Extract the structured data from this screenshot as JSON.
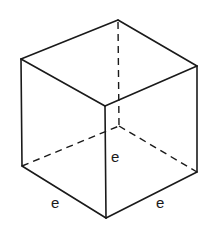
{
  "diagram": {
    "type": "cube-wireframe",
    "vertices": {
      "top_left": [
        21,
        59
      ],
      "top_back": [
        118,
        20
      ],
      "top_right": [
        197,
        66
      ],
      "top_front": [
        105,
        106
      ],
      "bottom_left": [
        22,
        166
      ],
      "bottom_front": [
        106,
        218
      ],
      "bottom_right": [
        197,
        172
      ],
      "hidden_back": [
        119,
        126
      ]
    },
    "labels": {
      "height": "e",
      "left_edge": "e",
      "right_edge": "e"
    },
    "colors": {
      "stroke": "#1a1a1a",
      "background": "#ffffff"
    }
  }
}
